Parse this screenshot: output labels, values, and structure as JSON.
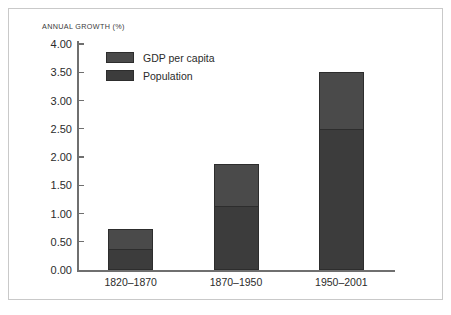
{
  "chart_data": {
    "type": "bar",
    "subtype": "stacked-bar",
    "title": "",
    "subtitle": "",
    "xlabel": "",
    "ylabel": "ANNUAL GROWTH (%)",
    "categories": [
      "1820–1870",
      "1870–1950",
      "1950–2001"
    ],
    "series": [
      {
        "name": "Population",
        "values": [
          0.38,
          1.13,
          2.5
        ],
        "color": "#3c3c3c"
      },
      {
        "name": "GDP per capita",
        "values": [
          0.34,
          0.74,
          1.01
        ],
        "color": "#4a4a4a"
      }
    ],
    "stack_totals": [
      0.72,
      1.87,
      3.51
    ],
    "ylim": [
      0.0,
      4.0
    ],
    "ytick_step": 0.5,
    "ytick_labels": [
      "4.00",
      "3.50",
      "3.00",
      "2.50",
      "2.00",
      "1.50",
      "1.00",
      "0.50",
      "0.00"
    ],
    "ytick_values": [
      4.0,
      3.5,
      3.0,
      2.5,
      2.0,
      1.5,
      1.0,
      0.5,
      0.0
    ],
    "grid": false,
    "legend_position": "top-left-inside",
    "legend_order": [
      "GDP per capita",
      "Population"
    ]
  },
  "legend": {
    "entries": [
      {
        "label": "GDP per capita",
        "color": "#4a4a4a"
      },
      {
        "label": "Population",
        "color": "#3c3c3c"
      }
    ]
  },
  "axis": {
    "title": "ANNUAL GROWTH (%)"
  },
  "colors": {
    "population": "#3c3c3c",
    "gdp_per_capita": "#4a4a4a",
    "axis_line": "#6f6f6f",
    "frame_border": "#c9c9c9",
    "text": "#2b2b2b",
    "background": "#ffffff"
  }
}
